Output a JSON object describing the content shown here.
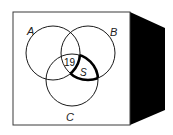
{
  "diagram": {
    "type": "venn",
    "sets": [
      {
        "id": "A",
        "label": "A"
      },
      {
        "id": "B",
        "label": "B"
      },
      {
        "id": "C",
        "label": "C"
      }
    ],
    "regions": [
      {
        "id": "ABC",
        "description": "A ∩ B ∩ C",
        "value": "19"
      },
      {
        "id": "S",
        "description": "B ∩ C (not A), outlined in bold",
        "value": "S"
      }
    ],
    "colors": {
      "line": "#1a1a1a",
      "box_fill": "#ffffff",
      "box_side": "#000000"
    }
  }
}
